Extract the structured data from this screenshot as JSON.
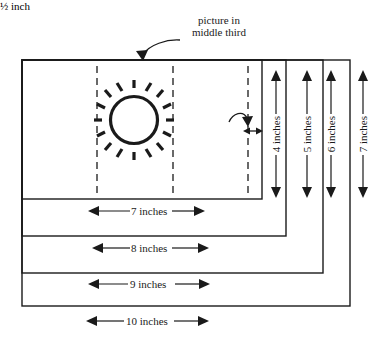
{
  "diagram": {
    "callout": {
      "line1": "picture in",
      "line2": "middle third"
    },
    "gap_label": "½ inch",
    "horizontal_dimensions": [
      {
        "label": "7 inches"
      },
      {
        "label": "8 inches"
      },
      {
        "label": "9 inches"
      },
      {
        "label": "10 inches"
      }
    ],
    "vertical_dimensions": [
      {
        "label": "4 inches"
      },
      {
        "label": "5 inches"
      },
      {
        "label": "6 inches"
      },
      {
        "label": "7 inches"
      }
    ],
    "colors": {
      "ink": "#1a1a1a",
      "paper": "#ffffff"
    },
    "icons": {
      "picture": "sun-icon",
      "callout_arrow": "curved-arrow-icon",
      "gap_arrow": "curved-arrow-icon",
      "dimension": "double-headed-arrow-icon"
    }
  }
}
